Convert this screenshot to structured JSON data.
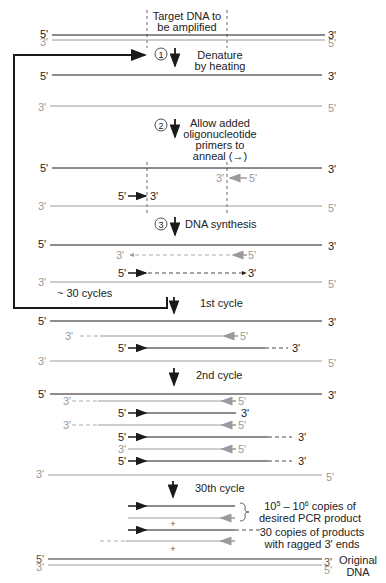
{
  "colors": {
    "top_strand": "#1a1a1a",
    "bottom_strand": "#9a9a9a",
    "loop": "#1a1a1a"
  },
  "labels": {
    "target": [
      "Target DNA to",
      "be amplified"
    ],
    "five": "5'",
    "three": "3'",
    "loop_label": "~ 30 cycles",
    "plus": "+"
  },
  "steps": [
    {
      "number": "①",
      "lines": [
        "Denature",
        "by heating"
      ]
    },
    {
      "number": "②",
      "lines": [
        "Allow added",
        "oligonucleotide",
        "primers to",
        "anneal (→)"
      ]
    },
    {
      "number": "③",
      "lines": [
        "DNA synthesis"
      ]
    }
  ],
  "cycles": {
    "first": "1st cycle",
    "second": "2nd cycle",
    "thirtieth": "30th cycle"
  },
  "annotations": {
    "desired": [
      "10⁵ – 10⁶ copies of",
      "desired PCR product"
    ],
    "ragged": [
      "30 copies of products",
      "with ragged 3' ends"
    ],
    "original": [
      "Original",
      "DNA"
    ]
  }
}
